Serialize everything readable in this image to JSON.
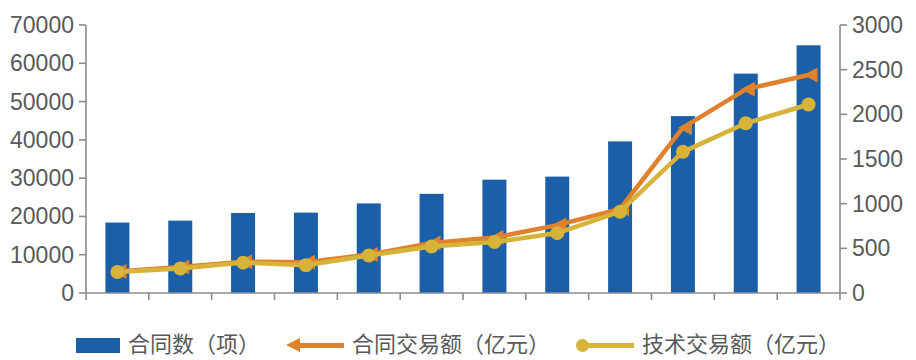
{
  "chart_data": {
    "type": "bar",
    "title": "",
    "xlabel": "",
    "ylabel": "",
    "categories": [
      "2011",
      "2012",
      "2013",
      "2014",
      "2015",
      "2016",
      "2017",
      "2018",
      "2019",
      "2020",
      "2021",
      "2022"
    ],
    "axes": {
      "left": {
        "label": "",
        "min": 0,
        "max": 70000,
        "step": 10000,
        "ticks": [
          "0",
          "10000",
          "20000",
          "30000",
          "40000",
          "50000",
          "60000",
          "70000"
        ]
      },
      "right": {
        "label": "",
        "min": 0,
        "max": 3000,
        "step": 500,
        "ticks": [
          "0",
          "500",
          "1000",
          "1500",
          "2000",
          "2500",
          "3000"
        ]
      }
    },
    "grid": false,
    "legend_position": "bottom",
    "series": [
      {
        "name": "合同数（项）",
        "type": "bar",
        "axis": "left",
        "color": "#1b5fa8",
        "values": [
          18400,
          18900,
          20900,
          21000,
          23400,
          25900,
          29600,
          30400,
          39600,
          46200,
          57300,
          64700
        ]
      },
      {
        "name": "合同交易额（亿元）",
        "type": "line",
        "axis": "right",
        "color": "#e0822c",
        "marker": "arrow",
        "values": [
          240,
          290,
          350,
          345,
          430,
          560,
          620,
          760,
          940,
          1850,
          2280,
          2440
        ]
      },
      {
        "name": "技术交易额（亿元）",
        "type": "line",
        "axis": "right",
        "color": "#d7b339",
        "marker": "circle",
        "values": [
          235,
          275,
          340,
          310,
          420,
          520,
          570,
          670,
          910,
          1580,
          1900,
          2110
        ]
      }
    ]
  },
  "legend": {
    "items": [
      {
        "label": "合同数（项）",
        "marker": "bar-swatch",
        "color": "#1b5fa8"
      },
      {
        "label": "合同交易额（亿元）",
        "marker": "arrow-line",
        "color": "#e0822c"
      },
      {
        "label": "技术交易额（亿元）",
        "marker": "dot-line",
        "color": "#d7b339"
      }
    ]
  }
}
